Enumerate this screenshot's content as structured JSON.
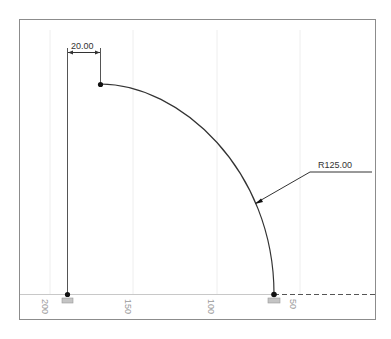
{
  "drawing": {
    "dimensions": {
      "horizontal_offset": "20.00",
      "radius": "R125.00"
    },
    "axis_labels": [
      "200",
      "150",
      "100",
      "50"
    ],
    "colors": {
      "frame": "#8c8c8c",
      "geometry": "#333333",
      "grid": "#ececec",
      "axis_text": "#9a9a9a",
      "ground_symbol": "#b0b0b0"
    }
  }
}
